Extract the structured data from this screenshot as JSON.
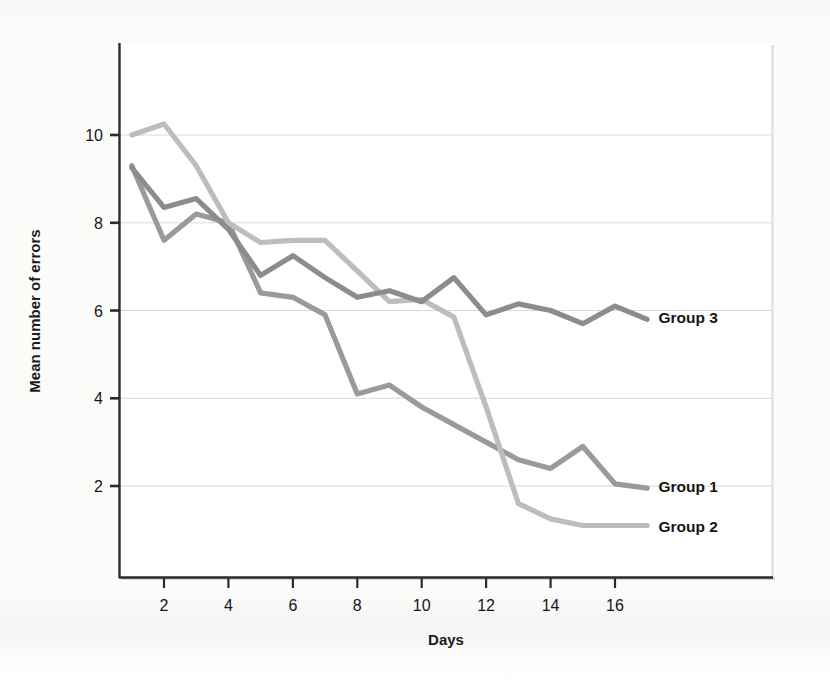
{
  "figure": {
    "background_color": "#fbfbfa",
    "plot_background_color": "#ffffff",
    "axis_color": "#2b2b2b",
    "gridline_color": "#d8d8d8"
  },
  "chart_data": {
    "type": "line",
    "title": "",
    "xlabel": "Days",
    "ylabel": "Mean number of errors",
    "xlim": [
      1,
      17.6
    ],
    "ylim": [
      0,
      12.2
    ],
    "xticks": [
      2,
      4,
      6,
      8,
      10,
      12,
      14,
      16
    ],
    "xtick_labels": [
      "2",
      "4",
      "6",
      "8",
      "10",
      "12",
      "14",
      "16"
    ],
    "yticks": [
      2,
      4,
      6,
      8,
      10
    ],
    "ytick_labels": [
      "2",
      "4",
      "6",
      "8",
      "10"
    ],
    "grid": "horizontal",
    "legend_position": "inline-right-end-labels",
    "x": [
      1,
      2,
      3,
      4,
      5,
      6,
      7,
      8,
      9,
      10,
      11,
      12,
      13,
      14,
      15,
      16,
      17
    ],
    "series": [
      {
        "name": "Group 1",
        "color": "#9a9a9a",
        "label": "Group 1",
        "label_x": 17.35,
        "label_y": 2.0,
        "values": [
          9.3,
          7.6,
          8.2,
          8.0,
          6.4,
          6.3,
          5.9,
          4.1,
          4.3,
          3.8,
          3.4,
          3.0,
          2.6,
          2.4,
          2.9,
          2.05,
          1.95
        ]
      },
      {
        "name": "Group 2",
        "color": "#bdbdbd",
        "label": "Group 2",
        "label_x": 17.35,
        "label_y": 1.1,
        "values": [
          10.0,
          10.25,
          9.3,
          8.0,
          7.55,
          7.6,
          7.6,
          6.9,
          6.2,
          6.25,
          5.85,
          3.8,
          1.6,
          1.25,
          1.1,
          1.1,
          1.1
        ]
      },
      {
        "name": "Group 3",
        "color": "#8c8c8c",
        "label": "Group 3",
        "label_x": 17.35,
        "label_y": 5.85,
        "values": [
          9.25,
          8.35,
          8.55,
          7.85,
          6.8,
          7.25,
          6.75,
          6.3,
          6.45,
          6.2,
          6.75,
          5.9,
          6.15,
          6.0,
          5.7,
          6.1,
          5.8
        ]
      }
    ]
  }
}
